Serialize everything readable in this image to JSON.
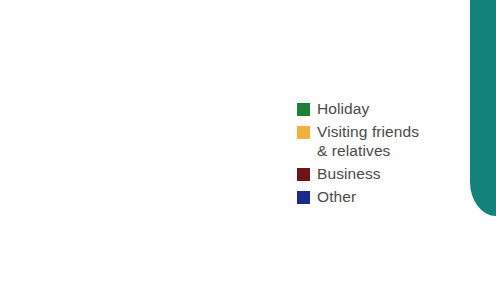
{
  "chart_data": {
    "type": "pie",
    "title": "",
    "subtitle": "",
    "xlabel": "",
    "ylabel": "",
    "grid": false,
    "legend_position": "right",
    "start_angle_deg": 0,
    "direction": "clockwise",
    "total_percent": 100,
    "categories": [
      "Holiday",
      "Visiting friends & relatives",
      "Business",
      "Other"
    ],
    "values": [
      50,
      25,
      18,
      7
    ],
    "value_unit": "percent",
    "slices": [
      {
        "label": "Holiday",
        "value": 50,
        "color": "#1c8039",
        "start_angle_deg": 0,
        "end_angle_deg": 180
      },
      {
        "label": "Visiting friends\n& relatives",
        "value": 25,
        "color": "#f2b03d",
        "start_angle_deg": 180,
        "end_angle_deg": 270
      },
      {
        "label": "Business",
        "value": 18,
        "color": "#6e1317",
        "start_angle_deg": 270,
        "end_angle_deg": 335
      },
      {
        "label": "Other",
        "value": 7,
        "color": "#1a2a8e",
        "start_angle_deg": 335,
        "end_angle_deg": 360
      }
    ]
  },
  "legend": {
    "items": [
      {
        "label": "Holiday",
        "color": "#1c8039"
      },
      {
        "label": "Visiting friends\n& relatives",
        "color": "#f2b03d"
      },
      {
        "label": "Business",
        "color": "#6e1317"
      },
      {
        "label": "Other",
        "color": "#1a2a8e"
      }
    ]
  },
  "decoration": {
    "page_edge_color": "#14837c"
  }
}
